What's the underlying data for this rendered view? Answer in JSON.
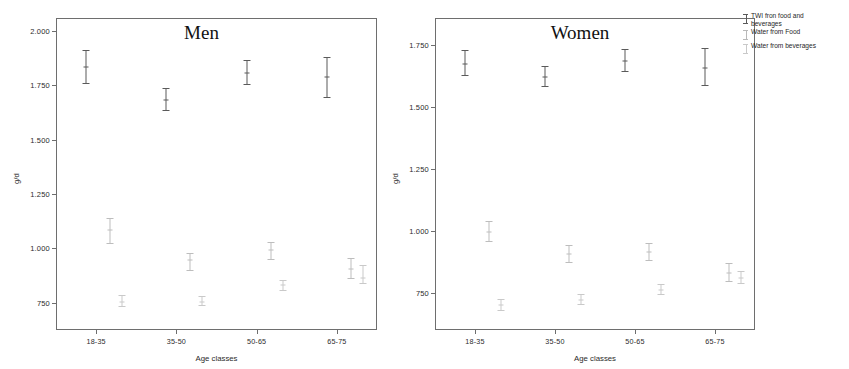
{
  "legend": {
    "items": [
      {
        "label": "TWI fron food and\nbeverages",
        "color": "#5a5a5a"
      },
      {
        "label": "Water from Food",
        "color": "#b9b9b9"
      },
      {
        "label": "Water from beverages",
        "color": "#c9c9c9"
      }
    ]
  },
  "panels": {
    "men": {
      "title": "Men",
      "ylabel": "g/d",
      "xlabel": "Age classes"
    },
    "women": {
      "title": "Women",
      "ylabel": "g/d",
      "xlabel": "Age classes"
    }
  },
  "chart_data": [
    {
      "type": "scatter",
      "title": "Men",
      "xlabel": "Age classes",
      "ylabel": "g/d",
      "categories": [
        "18-35",
        "35-50",
        "50-65",
        "65-75"
      ],
      "yticks": [
        "2.000",
        "1.750",
        "1.500",
        "1.250",
        "1.000",
        "750"
      ],
      "ytick_values": [
        2.0,
        1.75,
        1.5,
        1.25,
        1.0,
        0.75
      ],
      "ylim": [
        0.625,
        2.06
      ],
      "grid": false,
      "legend_position": "right-outside",
      "error_bar_meaning": "95% CI",
      "series": [
        {
          "name": "TWI fron food and beverages",
          "color": "#5a5a5a",
          "values": [
            1.835,
            1.685,
            1.805,
            1.79
          ],
          "ci_low": [
            1.755,
            1.63,
            1.75,
            1.69
          ],
          "ci_high": [
            1.915,
            1.74,
            1.865,
            1.88
          ]
        },
        {
          "name": "Water from Food",
          "color": "#bdbdbd",
          "values": [
            1.085,
            0.945,
            0.995,
            0.905
          ],
          "ci_low": [
            1.02,
            0.895,
            0.945,
            0.86
          ],
          "ci_high": [
            1.14,
            0.98,
            1.03,
            0.955
          ]
        },
        {
          "name": "Water from beverages",
          "color": "#c9c9c9",
          "values": [
            0.755,
            0.755,
            0.83,
            0.865
          ],
          "ci_low": [
            0.73,
            0.735,
            0.805,
            0.835
          ],
          "ci_high": [
            0.785,
            0.78,
            0.855,
            0.925
          ]
        }
      ]
    },
    {
      "type": "scatter",
      "title": "Women",
      "xlabel": "Age classes",
      "ylabel": "g/d",
      "categories": [
        "18-35",
        "35-50",
        "50-65",
        "65-75"
      ],
      "yticks": [
        "1.750",
        "1.500",
        "1.250",
        "1.000",
        "750"
      ],
      "ytick_values": [
        1.75,
        1.5,
        1.25,
        1.0,
        0.75
      ],
      "ylim": [
        0.6,
        1.86
      ],
      "grid": false,
      "legend_position": "right-outside",
      "error_bar_meaning": "95% CI",
      "series": [
        {
          "name": "TWI fron food and beverages",
          "color": "#5a5a5a",
          "values": [
            1.675,
            1.62,
            1.685,
            1.66
          ],
          "ci_low": [
            1.625,
            1.58,
            1.64,
            1.585
          ],
          "ci_high": [
            1.73,
            1.665,
            1.735,
            1.74
          ]
        },
        {
          "name": "Water from Food",
          "color": "#bdbdbd",
          "values": [
            0.995,
            0.905,
            0.915,
            0.83
          ],
          "ci_low": [
            0.955,
            0.87,
            0.88,
            0.795
          ],
          "ci_high": [
            1.04,
            0.945,
            0.95,
            0.87
          ]
        },
        {
          "name": "Water from beverages",
          "color": "#c9c9c9",
          "values": [
            0.7,
            0.72,
            0.76,
            0.81
          ],
          "ci_low": [
            0.675,
            0.7,
            0.74,
            0.785
          ],
          "ci_high": [
            0.725,
            0.745,
            0.785,
            0.84
          ]
        }
      ]
    }
  ]
}
